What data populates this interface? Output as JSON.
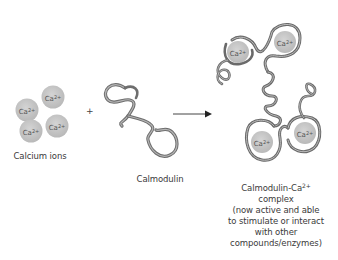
{
  "diagram": {
    "calcium_ions": {
      "label": "Calcium ions",
      "ion_symbol": "Ca",
      "ion_charge": "2+",
      "count": 4,
      "fill_color": "#c8c8c8"
    },
    "operator_plus": "+",
    "calmodulin": {
      "label": "Calmodulin"
    },
    "reaction_arrow": "→",
    "complex": {
      "title_main": "Calmodulin-Ca",
      "title_charge": "2+",
      "line2": "complex",
      "line3": "(now active and able",
      "line4": "to stimulate or interact",
      "line5": "with other",
      "line6": "compounds/enzymes)",
      "bound_ions": 4
    },
    "ribbon_color": "#8a8a8a"
  }
}
